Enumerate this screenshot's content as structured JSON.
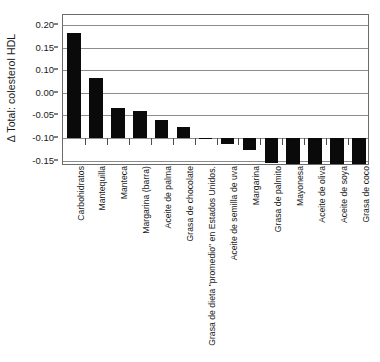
{
  "chart_data": {
    "type": "bar",
    "title": "",
    "subtitle": "",
    "xlabel": "",
    "ylabel": "Δ Total: colesterol HDL",
    "ylim": [
      -0.175,
      0.205
    ],
    "ytick_labels": [
      "0.20",
      "0.15",
      "0.10",
      "0.00",
      "-0.05",
      "-0.10",
      "-0.15"
    ],
    "ytick_values": [
      0.2,
      0.15,
      0.1,
      0.0,
      -0.05,
      -0.1,
      -0.15
    ],
    "baseline": -0.05,
    "grid": true,
    "legend": "none",
    "bar_color": "#0a0a0a",
    "categories": [
      "Carbohidratos",
      "Mantequilla",
      "Manteca",
      "Margarina (barra)",
      "Aceite de palma",
      "Grasa de chocolate",
      "Grasa de dieta \"promedio\" en Estados Unidos.",
      "Aceite de semilla de uva",
      "Margarina",
      "Grasa de palmito",
      "Mayonesa",
      "Aceite de oliva",
      "Aceite de soya",
      "Grasa de coco"
    ],
    "values": [
      0.183,
      0.083,
      0.017,
      0.009,
      -0.011,
      -0.026,
      -0.05,
      -0.063,
      -0.077,
      -0.105,
      -0.126,
      -0.127,
      -0.127,
      -0.163
    ]
  }
}
